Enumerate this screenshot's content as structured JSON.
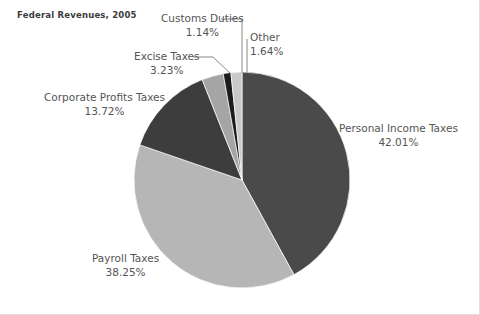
{
  "chart_title": "Federal Revenues, 2005",
  "chart_data": {
    "type": "pie",
    "title": "Federal Revenues, 2005",
    "xlabel": "",
    "ylabel": "",
    "units": "percent",
    "legend_position": "none",
    "grid": false,
    "start_angle_deg": 0,
    "direction": "clockwise",
    "categories": [
      "Personal Income Taxes",
      "Payroll Taxes",
      "Corporate Profits Taxes",
      "Excise Taxes",
      "Customs Duties",
      "Other"
    ],
    "values": [
      42.01,
      38.25,
      13.72,
      3.23,
      1.14,
      1.64
    ],
    "value_labels": [
      "42.01%",
      "38.25%",
      "13.72%",
      "3.23%",
      "1.14%",
      "1.64%"
    ],
    "colors": [
      "#4a4a4a",
      "#b6b6b6",
      "#3d3d3d",
      "#a5a5a5",
      "#1c1c1c",
      "#c9c9c9"
    ],
    "slices": [
      {
        "name": "Personal Income Taxes",
        "value": 42.01,
        "value_label": "42.01%",
        "color": "#4a4a4a",
        "label_align": "left",
        "has_leader_line": false
      },
      {
        "name": "Payroll Taxes",
        "value": 38.25,
        "value_label": "38.25%",
        "color": "#b6b6b6",
        "label_align": "center",
        "has_leader_line": false
      },
      {
        "name": "Corporate Profits Taxes",
        "value": 13.72,
        "value_label": "13.72%",
        "color": "#3d3d3d",
        "label_align": "center",
        "has_leader_line": false
      },
      {
        "name": "Excise Taxes",
        "value": 3.23,
        "value_label": "3.23%",
        "color": "#a5a5a5",
        "label_align": "center",
        "has_leader_line": true
      },
      {
        "name": "Customs Duties",
        "value": 1.14,
        "value_label": "1.14%",
        "color": "#1c1c1c",
        "label_align": "center",
        "has_leader_line": true
      },
      {
        "name": "Other",
        "value": 1.64,
        "value_label": "1.64%",
        "color": "#c9c9c9",
        "label_align": "left",
        "has_leader_line": true
      }
    ],
    "total": 99.99
  },
  "style": {
    "background": "#ffffff",
    "label_color": "#555555",
    "title_color": "#3b3b3b",
    "leader_line_color": "#7a7a7a",
    "border_color": "#dedede"
  },
  "geometry": {
    "center_x": 242,
    "center_y": 180,
    "radius": 108
  }
}
